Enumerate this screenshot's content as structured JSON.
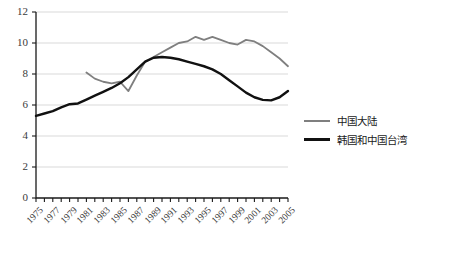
{
  "chart_data": {
    "type": "line",
    "title": "",
    "xlabel": "",
    "ylabel": "",
    "xlim": [
      1975,
      2005
    ],
    "ylim": [
      0,
      12
    ],
    "ytick_step": 2,
    "grid": true,
    "legend_position": "right",
    "yticks": [
      "0",
      "2",
      "4",
      "6",
      "8",
      "10",
      "12"
    ],
    "xticks": [
      "1975",
      "1977",
      "1979",
      "1981",
      "1983",
      "1985",
      "1987",
      "1989",
      "1991",
      "1993",
      "1995",
      "1997",
      "1999",
      "2001",
      "2003",
      "2005"
    ],
    "x": [
      1975,
      1976,
      1977,
      1978,
      1979,
      1980,
      1981,
      1982,
      1983,
      1984,
      1985,
      1986,
      1987,
      1988,
      1989,
      1990,
      1991,
      1992,
      1993,
      1994,
      1995,
      1996,
      1997,
      1998,
      1999,
      2000,
      2001,
      2002,
      2003,
      2004,
      2005
    ],
    "series": [
      {
        "name": "中国大陆",
        "color": "#7f7f7f",
        "width": 1.8,
        "x": [
          1981,
          1982,
          1983,
          1984,
          1985,
          1986,
          1987,
          1988,
          1989,
          1990,
          1991,
          1992,
          1993,
          1994,
          1995,
          1996,
          1997,
          1998,
          1999,
          2000,
          2001,
          2002,
          2003,
          2004,
          2005
        ],
        "values": [
          8.1,
          7.7,
          7.5,
          7.4,
          7.5,
          6.9,
          7.9,
          8.8,
          9.1,
          9.4,
          9.7,
          10.0,
          10.1,
          10.4,
          10.2,
          10.4,
          10.2,
          10.0,
          9.9,
          10.2,
          10.1,
          9.8,
          9.4,
          9.0,
          8.5
        ]
      },
      {
        "name": "韩国和中国台湾",
        "color": "#111111",
        "width": 2.4,
        "x": [
          1975,
          1976,
          1977,
          1978,
          1979,
          1980,
          1981,
          1982,
          1983,
          1984,
          1985,
          1986,
          1987,
          1988,
          1989,
          1990,
          1991,
          1992,
          1993,
          1994,
          1995,
          1996,
          1997,
          1998,
          1999,
          2000,
          2001,
          2002,
          2003,
          2004,
          2005
        ],
        "values": [
          5.3,
          5.45,
          5.6,
          5.85,
          6.05,
          6.1,
          6.35,
          6.6,
          6.85,
          7.1,
          7.4,
          7.8,
          8.3,
          8.8,
          9.05,
          9.1,
          9.05,
          8.95,
          8.8,
          8.65,
          8.5,
          8.3,
          8.0,
          7.6,
          7.2,
          6.8,
          6.5,
          6.33,
          6.3,
          6.5,
          6.9
        ]
      }
    ]
  },
  "legend": {
    "items": [
      {
        "label": "中国大陆",
        "color": "#7f7f7f",
        "thickness": "2px"
      },
      {
        "label": "韩国和中国台湾",
        "color": "#111111",
        "thickness": "3px"
      }
    ]
  },
  "caption": {
    "text": ""
  },
  "axes": {
    "axis_color": "#1a1a1a",
    "grid_color": "#d9d9d9"
  }
}
